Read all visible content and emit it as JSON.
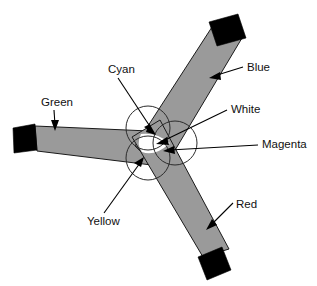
{
  "figure": {
    "background_color": "#ffffff",
    "beam_fill_color": "#9a9a9a",
    "beam_outline_color": "#1a1a1a",
    "projector_color": "#000000",
    "overlap_white_color": "#ffffff",
    "label_color": "#111111"
  },
  "labels": [
    {
      "id": "cyan",
      "text": "Cyan",
      "x": 108,
      "y": 70,
      "anchor": "start"
    },
    {
      "id": "blue",
      "text": "Blue",
      "x": 247,
      "y": 68,
      "anchor": "start"
    },
    {
      "id": "green",
      "text": "Green",
      "x": 41,
      "y": 103,
      "anchor": "start"
    },
    {
      "id": "white",
      "text": "White",
      "x": 231,
      "y": 110,
      "anchor": "start"
    },
    {
      "id": "magenta",
      "text": "Magenta",
      "x": 262,
      "y": 145,
      "anchor": "start"
    },
    {
      "id": "red",
      "text": "Red",
      "x": 236,
      "y": 205,
      "anchor": "start"
    },
    {
      "id": "yellow",
      "text": "Yellow",
      "x": 87,
      "y": 222,
      "anchor": "start"
    }
  ],
  "projectors": [
    {
      "id": "green-projector",
      "label": "Green",
      "points": "13,128 35,124 37,150 14,152"
    },
    {
      "id": "blue-projector",
      "label": "Blue",
      "points": "210,22 239,15 246,38 217,46"
    },
    {
      "id": "red-projector",
      "label": "Red",
      "points": "199,256 223,247 231,271 207,279"
    }
  ],
  "beams": [
    {
      "id": "green-beam",
      "label": "Green",
      "points": "35,126 37,151 168,167 172,132"
    },
    {
      "id": "blue-beam",
      "label": "Blue",
      "points": "212,27 242,38 162,170 138,146"
    },
    {
      "id": "red-beam",
      "label": "Red",
      "points": "203,256 228,249 160,122 134,136"
    }
  ],
  "mix_circles": [
    {
      "id": "circle-upper-left",
      "cx": 148,
      "cy": 128,
      "r": 22
    },
    {
      "id": "circle-lower-left",
      "cx": 148,
      "cy": 158,
      "r": 22
    },
    {
      "id": "circle-right",
      "cx": 175,
      "cy": 143,
      "r": 22
    }
  ],
  "white_region": {
    "id": "white-overlap",
    "description": "central three-beam overlap rendered white",
    "points": "145,135 169,143 146,155 141,145"
  },
  "leaders": [
    {
      "id": "cyan-leader",
      "from": [
        118,
        78
      ],
      "to": [
        152,
        131
      ],
      "arrow": true,
      "arrow_angle": 57
    },
    {
      "id": "blue-leader",
      "from": [
        244,
        67
      ],
      "to": [
        213,
        77
      ],
      "arrow": true,
      "arrow_angle": 198
    },
    {
      "id": "green-leader",
      "from": [
        53,
        110
      ],
      "to": [
        55,
        128
      ],
      "arrow": true,
      "arrow_angle": 84
    },
    {
      "id": "white-leader",
      "from": [
        228,
        110
      ],
      "to": [
        160,
        143
      ],
      "arrow": true,
      "arrow_angle": 206
    },
    {
      "id": "magenta-leader",
      "from": [
        259,
        145
      ],
      "to": [
        166,
        150
      ],
      "arrow": true,
      "arrow_angle": 183
    },
    {
      "id": "red-leader",
      "from": [
        234,
        204
      ],
      "to": [
        210,
        228
      ],
      "arrow": true,
      "arrow_angle": 135
    },
    {
      "id": "yellow-leader",
      "from": [
        104,
        214
      ],
      "to": [
        142,
        160
      ],
      "arrow": true,
      "arrow_angle": 305
    }
  ],
  "legend_meaning": {
    "cyan": "Overlap of green and blue beams",
    "yellow": "Overlap of green and red beams",
    "magenta": "Overlap of red and blue beams",
    "white": "Overlap of all three beams"
  }
}
